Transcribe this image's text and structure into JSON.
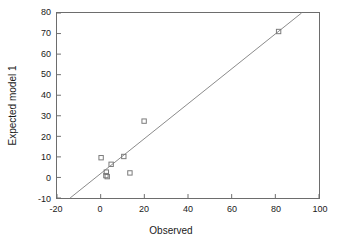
{
  "chart_data": {
    "type": "scatter",
    "title": "",
    "xlabel": "Observed",
    "ylabel": "Expected model 1",
    "xlim": [
      -20,
      100
    ],
    "ylim": [
      -10,
      80
    ],
    "xticks": [
      -20,
      0,
      20,
      40,
      60,
      80,
      100
    ],
    "yticks": [
      -10,
      0,
      10,
      20,
      30,
      40,
      50,
      60,
      70,
      80
    ],
    "xtick_labels": [
      "-20",
      "0",
      "20",
      "40",
      "60",
      "80",
      "100"
    ],
    "ytick_labels": [
      "-10",
      "0",
      "10",
      "20",
      "30",
      "40",
      "50",
      "60",
      "70",
      "80"
    ],
    "grid": false,
    "legend": false,
    "marker": "open-square",
    "marker_color": "#7a7a7a",
    "line_color": "#8a8a8a",
    "axis_color": "#6d6d6d",
    "series": [
      {
        "name": "observations",
        "points": [
          {
            "x": 0.2,
            "y": 9.6
          },
          {
            "x": 4.8,
            "y": 6.4
          },
          {
            "x": 10.6,
            "y": 10.2
          },
          {
            "x": 2.6,
            "y": 2.6
          },
          {
            "x": 2.4,
            "y": 0.9
          },
          {
            "x": 3.0,
            "y": 0.4
          },
          {
            "x": 13.4,
            "y": 2.2
          },
          {
            "x": 19.9,
            "y": 27.4
          },
          {
            "x": 81.5,
            "y": 71.0
          }
        ]
      }
    ],
    "reference_line": {
      "name": "identity-line",
      "x1": -14.0,
      "y1": -10.0,
      "x2": 92.0,
      "y2": 80.0
    }
  }
}
